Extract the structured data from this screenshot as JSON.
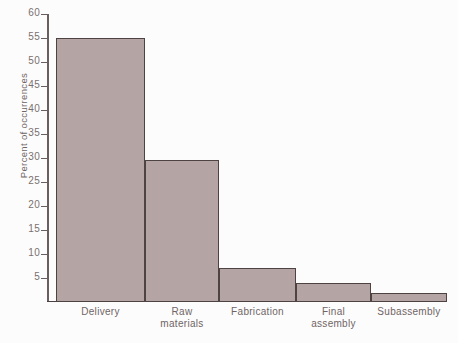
{
  "chart_data": {
    "type": "bar",
    "title": "",
    "xlabel": "",
    "ylabel": "Percent of occurrences",
    "categories": [
      "Delivery",
      "Raw materials",
      "Fabrication",
      "Final assembly",
      "Subassembly"
    ],
    "category_lines": [
      [
        "Delivery"
      ],
      [
        "Raw",
        "materials"
      ],
      [
        "Fabrication"
      ],
      [
        "Final",
        "assembly"
      ],
      [
        "Subassembly"
      ]
    ],
    "values": [
      55,
      29.5,
      7,
      4,
      1.8
    ],
    "ylim": [
      0,
      60
    ],
    "yticks": [
      60,
      55,
      50,
      45,
      40,
      35,
      30,
      25,
      20,
      15,
      10,
      5
    ],
    "ytick_labels": [
      "60",
      "55",
      "50",
      "45",
      "40",
      "35",
      "30",
      "25",
      "20",
      "15",
      "10",
      "5"
    ],
    "grid": false,
    "legend": null,
    "bar_color": "#b4a4a4",
    "bar_edge_color": "#4e4343",
    "axis_color": "#6a5f5f",
    "text_color": "#6f6565"
  }
}
